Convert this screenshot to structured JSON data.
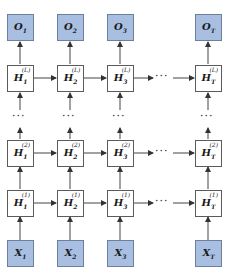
{
  "diagram": {
    "type": "stacked-rnn",
    "colors": {
      "io_fill": "#a9bfe2",
      "io_border": "#6d7f9c",
      "hidden_fill": "#ffffff",
      "border": "#5b5b5b"
    },
    "columns": [
      "1",
      "2",
      "3",
      "T"
    ],
    "ellipsis": "···",
    "outputs": [
      {
        "base": "O",
        "sub": "1"
      },
      {
        "base": "O",
        "sub": "2"
      },
      {
        "base": "O",
        "sub": "3"
      },
      {
        "base": "O",
        "sub": "T"
      }
    ],
    "hidden_L": [
      {
        "base": "H",
        "sub": "1",
        "sup": "(L)"
      },
      {
        "base": "H",
        "sub": "2",
        "sup": "(L)"
      },
      {
        "base": "H",
        "sub": "3",
        "sup": "(L)"
      },
      {
        "base": "H",
        "sub": "T",
        "sup": "(L)"
      }
    ],
    "hidden_2": [
      {
        "base": "H",
        "sub": "1",
        "sup": "(2)"
      },
      {
        "base": "H",
        "sub": "2",
        "sup": "(2)"
      },
      {
        "base": "H",
        "sub": "3",
        "sup": "(2)"
      },
      {
        "base": "H",
        "sub": "T",
        "sup": "(2)"
      }
    ],
    "hidden_1": [
      {
        "base": "H",
        "sub": "1",
        "sup": "(1)"
      },
      {
        "base": "H",
        "sub": "2",
        "sup": "(1)"
      },
      {
        "base": "H",
        "sub": "3",
        "sup": "(1)"
      },
      {
        "base": "H",
        "sub": "T",
        "sup": "(1)"
      }
    ],
    "inputs": [
      {
        "base": "X",
        "sub": "1"
      },
      {
        "base": "X",
        "sub": "2"
      },
      {
        "base": "X",
        "sub": "3"
      },
      {
        "base": "X",
        "sub": "T"
      }
    ]
  }
}
